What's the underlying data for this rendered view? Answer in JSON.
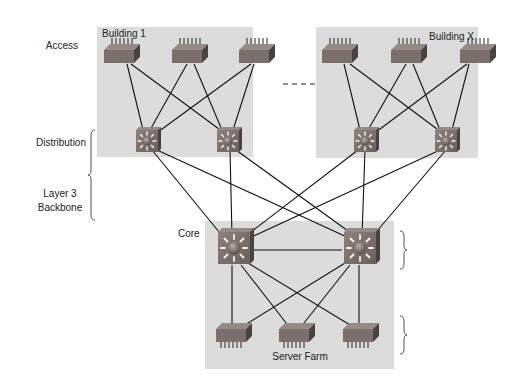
{
  "diagram": {
    "layer_labels": {
      "access": "Access",
      "distribution": "Distribution",
      "layer3_line1": "Layer 3",
      "layer3_line2": "Backbone",
      "core": "Core"
    },
    "groups": {
      "building_1": "Building 1",
      "building_x": "Building X",
      "server_farm": "Server Farm"
    },
    "colors": {
      "group_bg": "#dcdcdc",
      "switch_face": "#7a6f6a",
      "switch_side": "#4a4240",
      "switch_top": "#958a84",
      "link": "#111111",
      "text": "#222222"
    },
    "nodes": {
      "access_b1": [
        {
          "id": "b1-a1",
          "x": 121,
          "y": 53
        },
        {
          "id": "b1-a2",
          "x": 190,
          "y": 53
        },
        {
          "id": "b1-a3",
          "x": 258,
          "y": 53
        }
      ],
      "access_bx": [
        {
          "id": "bx-a1",
          "x": 340,
          "y": 53
        },
        {
          "id": "bx-a2",
          "x": 409,
          "y": 53
        },
        {
          "id": "bx-a3",
          "x": 476,
          "y": 53
        }
      ],
      "distribution": [
        {
          "id": "b1-d1",
          "x": 146,
          "y": 139
        },
        {
          "id": "b1-d2",
          "x": 228,
          "y": 139
        },
        {
          "id": "bx-d1",
          "x": 364,
          "y": 139
        },
        {
          "id": "bx-d2",
          "x": 446,
          "y": 139
        }
      ],
      "core": [
        {
          "id": "c1",
          "x": 232,
          "y": 250
        },
        {
          "id": "c2",
          "x": 359,
          "y": 250
        }
      ],
      "server_farm": [
        {
          "id": "s1",
          "x": 234,
          "y": 336
        },
        {
          "id": "s2",
          "x": 297,
          "y": 336
        },
        {
          "id": "s3",
          "x": 361,
          "y": 336
        }
      ]
    }
  }
}
